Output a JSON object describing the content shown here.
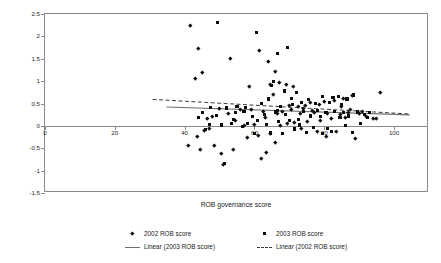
{
  "chart_data": {
    "type": "scatter",
    "title": "",
    "xlabel": "ROB governance score",
    "ylabel": "Change in market capital (%)",
    "xlim": [
      0,
      110
    ],
    "ylim": [
      -1.5,
      2.5
    ],
    "xticks": [
      0,
      20,
      40,
      60,
      80,
      100
    ],
    "yticks": [
      -1.5,
      -1,
      -0.5,
      0,
      0.5,
      1,
      1.5,
      2,
      2.5
    ],
    "xtick_labels": [
      "0",
      "20",
      "40",
      "60",
      "80",
      "100"
    ],
    "ytick_labels": [
      "-1.5",
      "-1",
      "-0.5",
      "0",
      "0.5",
      "1",
      "1.5",
      "2",
      "2.5"
    ],
    "grid": false,
    "zero_line": true,
    "legend_position": "below",
    "marker_color": "#0d0d0d",
    "axis_color": "#8a8a8a",
    "series": [
      {
        "name": "2002 ROB score",
        "marker": "diamond",
        "points": [
          [
            41.5,
            2.25
          ],
          [
            43.0,
            1.06
          ],
          [
            45.0,
            1.2
          ],
          [
            44.0,
            1.73
          ],
          [
            53.0,
            1.51
          ],
          [
            58.5,
            0.88
          ],
          [
            61.5,
            1.69
          ],
          [
            64.0,
            1.45
          ],
          [
            66.0,
            1.21
          ],
          [
            64.5,
            0.92
          ],
          [
            65.5,
            0.7
          ],
          [
            67.0,
            0.97
          ],
          [
            69.0,
            0.93
          ],
          [
            71.0,
            0.89
          ],
          [
            96.0,
            0.74
          ],
          [
            88.0,
            0.68
          ],
          [
            85.5,
            0.62
          ],
          [
            83.0,
            0.57
          ],
          [
            80.0,
            0.55
          ],
          [
            78.5,
            0.49
          ],
          [
            76.0,
            0.52
          ],
          [
            74.5,
            0.46
          ],
          [
            72.5,
            0.43
          ],
          [
            70.5,
            0.38
          ],
          [
            68.0,
            0.33
          ],
          [
            62.5,
            0.33
          ],
          [
            59.0,
            0.36
          ],
          [
            56.0,
            0.38
          ],
          [
            50.0,
            0.39
          ],
          [
            48.0,
            0.22
          ],
          [
            46.5,
            0.17
          ],
          [
            52.5,
            0.28
          ],
          [
            54.5,
            0.13
          ],
          [
            63.0,
            0.19
          ],
          [
            66.5,
            0.27
          ],
          [
            73.0,
            0.28
          ],
          [
            77.0,
            0.31
          ],
          [
            81.0,
            0.29
          ],
          [
            84.5,
            0.25
          ],
          [
            87.0,
            0.3
          ],
          [
            90.0,
            0.27
          ],
          [
            92.0,
            0.22
          ],
          [
            94.0,
            0.17
          ],
          [
            86.0,
            0.19
          ],
          [
            82.0,
            0.16
          ],
          [
            79.0,
            0.13
          ],
          [
            75.0,
            0.1
          ],
          [
            71.5,
            0.07
          ],
          [
            69.5,
            0.05
          ],
          [
            67.5,
            0.02
          ],
          [
            60.0,
            0.04
          ],
          [
            57.0,
            0.02
          ],
          [
            47.0,
            -0.05
          ],
          [
            45.5,
            -0.1
          ],
          [
            43.5,
            -0.23
          ],
          [
            41.0,
            -0.43
          ],
          [
            44.5,
            -0.52
          ],
          [
            48.5,
            -0.44
          ],
          [
            50.5,
            -0.61
          ],
          [
            54.0,
            -0.52
          ],
          [
            51.0,
            -0.86
          ],
          [
            58.0,
            -0.25
          ],
          [
            61.0,
            -0.2
          ],
          [
            64.5,
            -0.16
          ],
          [
            66.0,
            -0.36
          ],
          [
            63.5,
            -0.58
          ],
          [
            62.0,
            -0.72
          ],
          [
            73.5,
            -0.05
          ],
          [
            78.0,
            -0.11
          ],
          [
            80.5,
            -0.23
          ],
          [
            83.5,
            -0.13
          ],
          [
            89.0,
            -0.28
          ],
          [
            95.0,
            0.16
          ],
          [
            76.5,
            0.35
          ],
          [
            74.0,
            0.4
          ],
          [
            70.0,
            0.45
          ],
          [
            85.0,
            0.43
          ],
          [
            87.5,
            0.38
          ],
          [
            91.0,
            0.33
          ]
        ]
      },
      {
        "name": "2003 ROB score",
        "marker": "square",
        "points": [
          [
            49.5,
            2.32
          ],
          [
            60.5,
            2.09
          ],
          [
            69.5,
            1.76
          ],
          [
            66.5,
            1.61
          ],
          [
            65.5,
            1.0
          ],
          [
            65.0,
            0.9
          ],
          [
            68.5,
            0.78
          ],
          [
            72.0,
            0.75
          ],
          [
            70.5,
            0.62
          ],
          [
            75.5,
            0.58
          ],
          [
            79.5,
            0.66
          ],
          [
            82.5,
            0.63
          ],
          [
            84.0,
            0.66
          ],
          [
            88.5,
            0.69
          ],
          [
            86.5,
            0.6
          ],
          [
            81.5,
            0.53
          ],
          [
            77.5,
            0.5
          ],
          [
            73.5,
            0.53
          ],
          [
            71.0,
            0.48
          ],
          [
            67.5,
            0.44
          ],
          [
            64.0,
            0.6
          ],
          [
            62.0,
            0.5
          ],
          [
            57.5,
            0.42
          ],
          [
            55.0,
            0.44
          ],
          [
            52.0,
            0.4
          ],
          [
            47.5,
            0.41
          ],
          [
            45.0,
            0.29
          ],
          [
            49.0,
            0.24
          ],
          [
            54.5,
            0.3
          ],
          [
            59.5,
            0.21
          ],
          [
            63.0,
            0.25
          ],
          [
            66.0,
            0.31
          ],
          [
            69.0,
            0.26
          ],
          [
            74.0,
            0.33
          ],
          [
            78.0,
            0.35
          ],
          [
            80.5,
            0.3
          ],
          [
            83.0,
            0.33
          ],
          [
            85.5,
            0.29
          ],
          [
            89.5,
            0.31
          ],
          [
            91.5,
            0.25
          ],
          [
            93.0,
            0.29
          ],
          [
            87.0,
            0.22
          ],
          [
            84.5,
            0.18
          ],
          [
            79.0,
            0.2
          ],
          [
            76.0,
            0.22
          ],
          [
            72.5,
            0.15
          ],
          [
            70.0,
            0.12
          ],
          [
            67.0,
            0.09
          ],
          [
            61.0,
            0.12
          ],
          [
            58.0,
            0.06
          ],
          [
            53.5,
            0.05
          ],
          [
            50.5,
            0.02
          ],
          [
            46.0,
            -0.08
          ],
          [
            47.0,
            0.03
          ],
          [
            56.5,
            -0.02
          ],
          [
            63.5,
            0.04
          ],
          [
            73.0,
            0.02
          ],
          [
            77.0,
            -0.03
          ],
          [
            81.0,
            -0.05
          ],
          [
            86.0,
            0.0
          ],
          [
            90.5,
            0.05
          ],
          [
            54.0,
            0.14
          ],
          [
            68.0,
            -0.17
          ],
          [
            71.5,
            -0.07
          ],
          [
            75.0,
            -0.15
          ],
          [
            79.5,
            -0.18
          ],
          [
            82.0,
            -0.12
          ],
          [
            88.0,
            -0.14
          ],
          [
            51.5,
            -0.85
          ],
          [
            64.5,
            -0.16
          ],
          [
            60.0,
            -0.18
          ],
          [
            66.5,
            0.34
          ],
          [
            85.0,
            0.47
          ],
          [
            92.5,
            0.18
          ],
          [
            57.0,
            0.33
          ],
          [
            44.0,
            0.19
          ]
        ]
      }
    ],
    "trendlines": [
      {
        "name": "Linear (2003 ROB score)",
        "style": "solid",
        "color": "#6f6f6f",
        "x_start": 35,
        "y_start": 0.4,
        "x_end": 105,
        "y_end": 0.22
      },
      {
        "name": "Linear (2002 ROB score)",
        "style": "dashed",
        "color": "#3b3b3b",
        "x_start": 31,
        "y_start": 0.57,
        "x_end": 105,
        "y_end": 0.24
      }
    ],
    "legend": [
      {
        "label": "2002 ROB score",
        "key": "diamond-marker"
      },
      {
        "label": "2003 ROB score",
        "key": "square-marker"
      },
      {
        "label": "Linear (2003 ROB score)",
        "key": "solid-line"
      },
      {
        "label": "Linear (2002 ROB score)",
        "key": "dashed-line"
      }
    ]
  }
}
